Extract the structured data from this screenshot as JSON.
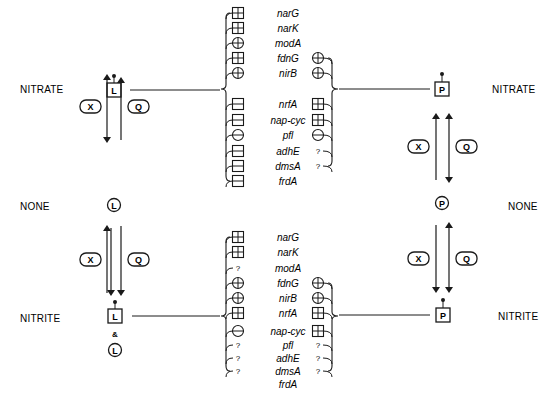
{
  "conditions": {
    "left": {
      "top": "NITRATE",
      "middle": "NONE",
      "bottom": "NITRITE"
    },
    "right": {
      "top": "NITRATE",
      "middle": "NONE",
      "bottom": "NITRITE"
    }
  },
  "regulators": {
    "left_letter": "L",
    "right_letter": "P",
    "ampersand": "&",
    "kinase_label": "X",
    "phosphatase_label": "Q"
  },
  "nitrate_panel": {
    "genes": [
      "narG",
      "narK",
      "modA",
      "fdnG",
      "nirB",
      "nrfA",
      "nap-cyc",
      "pfl",
      "adhE",
      "dmsA",
      "frdA"
    ],
    "left_effects": [
      "box-plus",
      "box-plus",
      "circle-plus",
      "box-plus",
      "circle-plus",
      "box-minus",
      "box-minus",
      "circle-minus",
      "box-minus",
      "box-minus",
      "box-minus"
    ],
    "right_effects": [
      null,
      null,
      null,
      "circle-plus",
      "circle-plus",
      "box-plus",
      "box-plus",
      "circle-minus",
      "?",
      "?",
      null
    ]
  },
  "nitrite_panel": {
    "genes": [
      "narG",
      "narK",
      "modA",
      "fdnG",
      "nirB",
      "nrfA",
      "nap-cyc",
      "pfl",
      "adhE",
      "dmsA",
      "frdA"
    ],
    "left_effects": [
      "box-plus",
      "box-plus",
      "?",
      "circle-plus",
      "circle-plus",
      "box-plus",
      "circle-minus",
      "?",
      "?",
      "?",
      null
    ],
    "right_effects": [
      null,
      null,
      null,
      "circle-plus",
      "circle-plus",
      "box-plus",
      "box-plus",
      "?",
      "?",
      "?",
      null
    ]
  },
  "unknown_mark": "?"
}
